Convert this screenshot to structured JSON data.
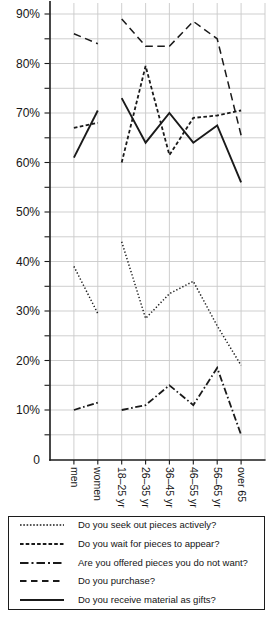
{
  "figure": {
    "background_color": "#ffffff",
    "line_color": "#1a1a1a",
    "grid_color": "#c9c9c9"
  },
  "chart_data": {
    "type": "line",
    "title": "",
    "xlabel": "",
    "ylabel": "",
    "categories": [
      "men",
      "women",
      "18–25 yr",
      "26–35 yr",
      "36–45 yr",
      "46–55 yr",
      "56–65 yr",
      "over 65"
    ],
    "series": [
      {
        "name": "Do you seek out pieces actively?",
        "style": "dotted",
        "values": [
          39,
          29.5,
          44,
          28.5,
          33.5,
          36,
          27,
          19
        ]
      },
      {
        "name": "Do you wait for pieces to appear?",
        "style": "short-dash",
        "values": [
          67,
          68,
          60,
          79.5,
          61.5,
          69,
          69.5,
          70.5
        ]
      },
      {
        "name": "Are you offered pieces you do not want?",
        "style": "dash-dot",
        "values": [
          10,
          11.5,
          10,
          11,
          15,
          11,
          18.5,
          5
        ]
      },
      {
        "name": "Do you purchase?",
        "style": "long-dash",
        "values": [
          86,
          84,
          89,
          83.5,
          83.5,
          88.5,
          85,
          65.5
        ]
      },
      {
        "name": "Do you receive material as gifts?",
        "style": "solid",
        "values": [
          61,
          70.5,
          73,
          64,
          70,
          64,
          67.5,
          56
        ]
      }
    ],
    "ylim": [
      0,
      93
    ],
    "y_tick_labels": [
      "0",
      "10%",
      "20%",
      "30%",
      "40%",
      "50%",
      "60%",
      "70%",
      "80%",
      "90%"
    ],
    "y_label_step": 10,
    "y_grid_step": 5,
    "grid": true,
    "legend_position": "bottom",
    "segment_break_after_index": 1
  }
}
